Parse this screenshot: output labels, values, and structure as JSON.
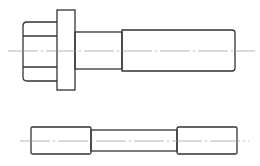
{
  "diagram": {
    "title": "",
    "type": "technical-drawing",
    "views": [
      {
        "name": "flanged-bolt-side-view",
        "parts": [
          "head",
          "flange",
          "shank",
          "threaded-body",
          "centerline"
        ]
      },
      {
        "name": "pin-side-view",
        "parts": [
          "left-end",
          "middle-neck",
          "right-end",
          "centerline"
        ]
      }
    ],
    "colors": {
      "line": "#333333",
      "centerline": "#888888",
      "background": "#ffffff"
    }
  },
  "watermark": {
    "text": ""
  }
}
